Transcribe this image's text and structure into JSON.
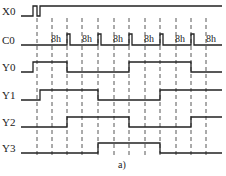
{
  "figure": {
    "caption": "a)",
    "line_color": "#222222",
    "background": "#ffffff"
  },
  "signals": [
    {
      "name": "X0",
      "low_y": 16,
      "high_y": 6,
      "edges": [
        21,
        33,
        37,
        40
      ],
      "start": "low",
      "end_x": 222
    },
    {
      "name": "C0",
      "low_y": 45,
      "high_y": 34,
      "pulses": [
        [
          67,
          70
        ],
        [
          98,
          101
        ],
        [
          129,
          132
        ],
        [
          160,
          163
        ],
        [
          191,
          194
        ]
      ],
      "start": "low",
      "end_x": 222
    },
    {
      "name": "Y0",
      "low_y": 72,
      "high_y": 62,
      "edges": [
        21,
        33,
        67,
        129,
        191
      ],
      "start": "low",
      "end_x": 222
    },
    {
      "name": "Y1",
      "low_y": 100,
      "high_y": 90,
      "edges": [
        21,
        40,
        98,
        160
      ],
      "start": "low",
      "end_x": 222
    },
    {
      "name": "Y2",
      "low_y": 127,
      "high_y": 117,
      "edges": [
        21,
        67,
        129,
        191
      ],
      "start": "low",
      "end_x": 222
    },
    {
      "name": "Y3",
      "low_y": 153,
      "high_y": 143,
      "edges": [
        21,
        98,
        160
      ],
      "start": "low",
      "end_x": 222
    }
  ],
  "c0_labels": [
    "8h",
    "8h",
    "8h",
    "8h",
    "8h",
    "8h"
  ],
  "c0_label_x": [
    50,
    81,
    112,
    143,
    174,
    205
  ],
  "dashed_lines_x": [
    37,
    52,
    67,
    82,
    98,
    114,
    129,
    145,
    160,
    176,
    191,
    206
  ],
  "dashed_range": [
    18,
    158
  ]
}
